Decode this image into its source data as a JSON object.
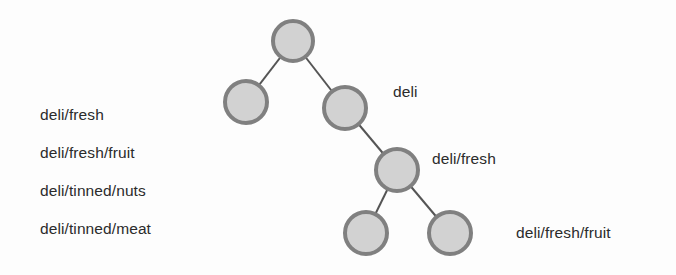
{
  "figure": {
    "background_color": "#fdfdfd",
    "text_color": "#2b2b2b"
  },
  "path_list": {
    "items": [
      {
        "label": "deli/fresh",
        "x": 40,
        "y": 107
      },
      {
        "label": "deli/fresh/fruit",
        "x": 40,
        "y": 145
      },
      {
        "label": "deli/tinned/nuts",
        "x": 40,
        "y": 183
      },
      {
        "label": "deli/tinned/meat",
        "x": 40,
        "y": 221
      }
    ]
  },
  "callouts": [
    {
      "name": "callout-deli",
      "label": "deli",
      "x": 393,
      "y": 84
    },
    {
      "name": "callout-deli-fresh",
      "label": "deli/fresh",
      "x": 432,
      "y": 151
    },
    {
      "name": "callout-deli-fresh-fruit",
      "label": "deli/fresh/fruit",
      "x": 516,
      "y": 225
    }
  ],
  "tree": {
    "node_fill": "#d2d2d2",
    "node_stroke": "#808080",
    "node_stroke_width": 4,
    "edge_color": "#555555",
    "edge_width": 2,
    "nodes": [
      {
        "name": "node-root",
        "cx": 293,
        "cy": 41,
        "r": 20
      },
      {
        "name": "node-left-child",
        "cx": 246,
        "cy": 102,
        "r": 21
      },
      {
        "name": "node-right-child",
        "cx": 345,
        "cy": 108,
        "r": 21
      },
      {
        "name": "node-deli-fresh",
        "cx": 397,
        "cy": 170,
        "r": 21
      },
      {
        "name": "node-leaf-left",
        "cx": 366,
        "cy": 233,
        "r": 21
      },
      {
        "name": "node-leaf-right",
        "cx": 450,
        "cy": 233,
        "r": 21
      }
    ],
    "edges": [
      {
        "name": "edge-root-to-left-child",
        "x1": 293,
        "y1": 41,
        "x2": 246,
        "y2": 102
      },
      {
        "name": "edge-root-to-right-child",
        "x1": 293,
        "y1": 41,
        "x2": 345,
        "y2": 108
      },
      {
        "name": "edge-right-child-to-deli-fresh",
        "x1": 345,
        "y1": 108,
        "x2": 397,
        "y2": 170
      },
      {
        "name": "edge-deli-fresh-to-leaf-left",
        "x1": 397,
        "y1": 170,
        "x2": 366,
        "y2": 233
      },
      {
        "name": "edge-deli-fresh-to-leaf-right",
        "x1": 397,
        "y1": 170,
        "x2": 450,
        "y2": 233
      }
    ]
  }
}
